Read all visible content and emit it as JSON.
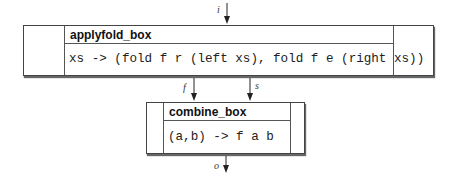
{
  "diagram": {
    "boxes": [
      {
        "id": "applyfold_box",
        "title": "applyfold_box",
        "body": "xs -> (fold f r (left xs), fold f e (right xs))"
      },
      {
        "id": "combine_box",
        "title": "combine_box",
        "body": "(a,b) -> f a b"
      }
    ],
    "edges": [
      {
        "label": "i",
        "from": "input",
        "to": "applyfold_box"
      },
      {
        "label": "f",
        "from": "applyfold_box",
        "to": "combine_box"
      },
      {
        "label": "s",
        "from": "applyfold_box",
        "to": "combine_box"
      },
      {
        "label": "o",
        "from": "combine_box",
        "to": "output"
      }
    ],
    "colors": {
      "stroke": "#444444",
      "background": "#ffffff"
    }
  }
}
